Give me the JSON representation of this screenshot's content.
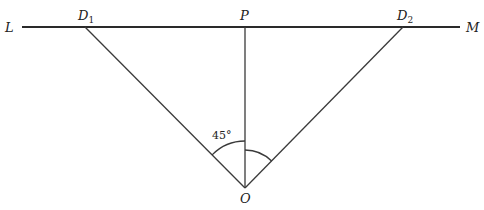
{
  "diagram": {
    "labels": {
      "L": "L",
      "M": "M",
      "D1": "D",
      "D1_sub": "1",
      "D2": "D",
      "D2_sub": "2",
      "P": "P",
      "O": "O",
      "angle": "45°"
    },
    "points": {
      "L_end": [
        22,
        27
      ],
      "M_end": [
        460,
        27
      ],
      "D1": [
        85,
        27
      ],
      "P": [
        245,
        27
      ],
      "D2": [
        403,
        27
      ],
      "O": [
        245,
        188
      ]
    },
    "segments": [
      [
        "L_end",
        "M_end"
      ],
      [
        "D1",
        "O"
      ],
      [
        "P",
        "O"
      ],
      [
        "D2",
        "O"
      ]
    ],
    "angle_marks": [
      {
        "between": [
          "D1",
          "P"
        ],
        "at": "O",
        "label": "45°"
      },
      {
        "between": [
          "P",
          "D2"
        ],
        "at": "O",
        "label": ""
      }
    ]
  }
}
